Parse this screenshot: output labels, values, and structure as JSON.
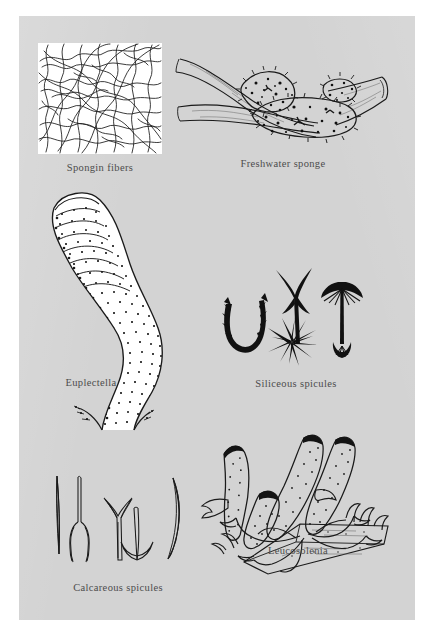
{
  "plate": {
    "title": "Sponge diversity figure plate",
    "background_color": "#ffffff",
    "panel_color": "#d3d3d3",
    "ink_color": "#1a1a1a",
    "caption_color": "#4c4c4c"
  },
  "figures": [
    {
      "id": "spongin-fibers",
      "caption": "Spongin fibers",
      "subject": "microscopic view of tangled spongin fiber network",
      "art_style": "line drawing on white inset box"
    },
    {
      "id": "freshwater-sponge",
      "caption": "Freshwater sponge",
      "subject": "lumpy speckled sponge encrusting a forked twig",
      "art_style": "stippled line drawing"
    },
    {
      "id": "euplectella",
      "caption": "Euplectella",
      "subject": "S-curved glass sponge tube (Venus flower basket) with latticed wall and flared rooting base",
      "art_style": "stippled line drawing"
    },
    {
      "id": "siliceous-spicules",
      "caption": "Siliceous spicules",
      "subject": "four spicule forms: barbed U hook, three-rayed triaxon, many-rayed aster, umbrella-headed anchor",
      "art_style": "solid black line drawing",
      "spicule_count": 4
    },
    {
      "id": "calcareous-spicules",
      "caption": "Calcareous spicules",
      "subject": "five spicule forms: straight needle, tuning-fork diactine, Y-shaped triradiate, anchor, curved needle",
      "art_style": "outline line drawing",
      "spicule_count": 5
    },
    {
      "id": "leucosolenia",
      "caption": "Leucosolenia",
      "subject": "cluster of finger-like sponge tubes with dark oscula joined by stolons on a substrate",
      "art_style": "stippled line drawing"
    }
  ]
}
